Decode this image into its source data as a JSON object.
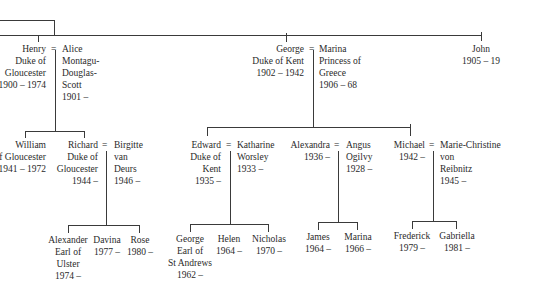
{
  "generation1": {
    "henry": {
      "lines": [
        "Henry",
        "Duke of",
        "Gloucester",
        "1900 – 1974"
      ]
    },
    "alice": {
      "lines": [
        "Alice",
        "Montagu-",
        "Douglas-",
        "Scott",
        "1901 –"
      ]
    },
    "george": {
      "lines": [
        "George",
        "Duke of Kent",
        "1902 – 1942"
      ]
    },
    "marina": {
      "lines": [
        "Marina",
        "Princess of",
        "Greece",
        "1906 – 68"
      ]
    },
    "john": {
      "lines": [
        "John",
        "1905 – 19"
      ]
    }
  },
  "generation2": {
    "william": {
      "lines": [
        "William",
        "of Gloucester",
        "1941 – 1972"
      ]
    },
    "richard": {
      "lines": [
        "Richard",
        "Duke of",
        "Gloucester",
        "1944 –"
      ]
    },
    "birgitte": {
      "lines": [
        "Birgitte",
        "van",
        "Deurs",
        "1946 –"
      ]
    },
    "edward": {
      "lines": [
        "Edward",
        "Duke of",
        "Kent",
        "1935 –"
      ]
    },
    "katharine": {
      "lines": [
        "Katharine",
        "Worsley",
        "1933 –"
      ]
    },
    "alexandra": {
      "lines": [
        "Alexandra",
        "1936 –"
      ]
    },
    "angus": {
      "lines": [
        "Angus",
        "Ogilvy",
        "1928 –"
      ]
    },
    "michael": {
      "lines": [
        "Michael",
        "1942 –"
      ]
    },
    "marie_christine": {
      "lines": [
        "Marie-Christine",
        "von",
        "Reibnitz",
        "1945 –"
      ]
    }
  },
  "generation3": {
    "alexander": {
      "lines": [
        "Alexander",
        "Earl of",
        "Ulster",
        "1974 –"
      ]
    },
    "davina": {
      "lines": [
        "Davina",
        "1977 –"
      ]
    },
    "rose": {
      "lines": [
        "Rose",
        "1980 –"
      ]
    },
    "george_st_andrews": {
      "lines": [
        "George",
        "Earl of",
        "St Andrews",
        "1962 –"
      ]
    },
    "helen": {
      "lines": [
        "Helen",
        "1964 –"
      ]
    },
    "nicholas": {
      "lines": [
        "Nicholas",
        "1970 –"
      ]
    },
    "james": {
      "lines": [
        "James",
        "1964 –"
      ]
    },
    "marina_ogilvy": {
      "lines": [
        "Marina",
        "1966 –"
      ]
    },
    "frederick": {
      "lines": [
        "Frederick",
        "1979 –"
      ]
    },
    "gabriella": {
      "lines": [
        "Gabriella",
        "1981 –"
      ]
    }
  },
  "marriage_symbol": "="
}
